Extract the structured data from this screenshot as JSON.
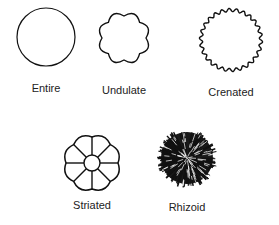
{
  "colony_margins": [
    {
      "name": "Entire",
      "label_x": 46,
      "label_y": 82
    },
    {
      "name": "Undulate",
      "label_x": 124,
      "label_y": 84
    },
    {
      "name": "Crenated",
      "label_x": 231,
      "label_y": 86
    },
    {
      "name": "Striated",
      "label_x": 92,
      "label_y": 199
    },
    {
      "name": "Rhizoid",
      "label_x": 187,
      "label_y": 201
    }
  ],
  "colors": {
    "stroke": "#111111",
    "text": "#222222",
    "background": "#ffffff"
  }
}
